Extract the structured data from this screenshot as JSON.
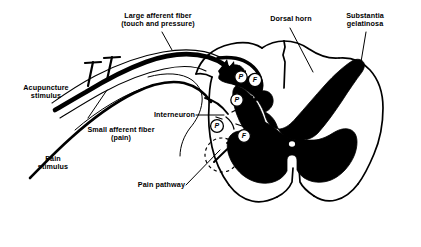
{
  "figure": {
    "type": "anatomical-diagram",
    "background_color": "#ffffff",
    "ink_color": "#000000"
  },
  "labels": {
    "large_afferent_fiber": "Large afferent fiber\n(touch and pressure)",
    "dorsal_horn": "Dorsal horn",
    "substantia_gelatinosa": "Substantia\ngelatinosa",
    "acupuncture_stimulus": "Acupuncture\nstimulus",
    "small_afferent_fiber": "Small afferent fiber\n(pain)",
    "interneuron": "Interneuron",
    "pain_stimulus": "Pain\nstimulus",
    "pain_pathway": "Pain pathway"
  },
  "markers": {
    "synapse_upper_inner": "P",
    "synapse_upper_outer": "F",
    "synapse_mid": "P",
    "synapse_lower_left": "P",
    "synapse_lower_right": "F"
  },
  "anatomy": {
    "gray_matter": "butterfly-shaped gray matter",
    "central_canal": "central canal",
    "needle_count": 2
  }
}
